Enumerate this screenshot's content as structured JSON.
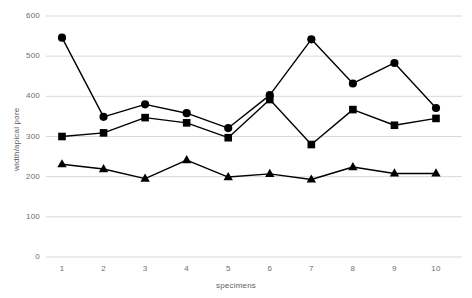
{
  "chart_data": {
    "type": "line",
    "title": "",
    "xlabel": "specimens",
    "ylabel": "width/apical pore",
    "categories": [
      "1",
      "2",
      "3",
      "4",
      "5",
      "6",
      "7",
      "8",
      "9",
      "10"
    ],
    "x": [
      1,
      2,
      3,
      4,
      5,
      6,
      7,
      8,
      9,
      10
    ],
    "xlim": [
      0.5,
      10.5
    ],
    "ylim": [
      0,
      600
    ],
    "yticks": [
      0,
      100,
      200,
      300,
      400,
      500,
      600
    ],
    "grid": true,
    "legend": "none",
    "series": [
      {
        "name": "circle-series",
        "marker": "circle",
        "color": "#000000",
        "values": [
          546,
          349,
          380,
          358,
          321,
          403,
          542,
          432,
          483,
          371
        ]
      },
      {
        "name": "square-series",
        "marker": "square",
        "color": "#000000",
        "values": [
          300,
          309,
          347,
          334,
          297,
          392,
          280,
          367,
          328,
          345
        ]
      },
      {
        "name": "triangle-series",
        "marker": "triangle",
        "color": "#000000",
        "values": [
          231,
          219,
          195,
          241,
          199,
          207,
          193,
          224,
          208,
          208
        ]
      }
    ]
  },
  "axes": {
    "y_tick_labels": [
      "600",
      "500",
      "400",
      "300",
      "200",
      "100",
      "0"
    ],
    "x_tick_labels": [
      "1",
      "2",
      "3",
      "4",
      "5",
      "6",
      "7",
      "8",
      "9",
      "10"
    ],
    "y_title": "width/apical pore",
    "x_title": "specimens"
  },
  "style": {
    "grid_color": "#d9d9d9",
    "line_color": "#000000",
    "marker_color": "#000000",
    "tick_text_color": "#6d6d6d",
    "background": "#ffffff"
  }
}
